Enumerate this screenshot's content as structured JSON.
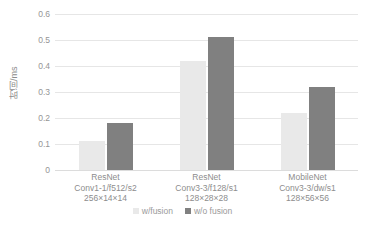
{
  "chart_data": {
    "type": "bar",
    "title": "",
    "xlabel": "",
    "ylabel": "时间/ms",
    "ylim": [
      0,
      0.6
    ],
    "yticks": [
      "0.6",
      "0.5",
      "0.4",
      "0.3",
      "0.2",
      "0.1",
      "0"
    ],
    "ytick_values": [
      0.6,
      0.5,
      0.4,
      0.3,
      0.2,
      0.1,
      0
    ],
    "grid": true,
    "legend_position": "bottom",
    "categories": [
      {
        "lines": [
          "ResNet",
          "Conv1-1/f512/s2",
          "256×14×14"
        ],
        "name": "ResNet Conv1-1/f512/s2 256×14×14"
      },
      {
        "lines": [
          "ResNet",
          "Conv3-3/f128/s1",
          "128×28×28"
        ],
        "name": "ResNet Conv3-3/f128/s1 128×28×28"
      },
      {
        "lines": [
          "MobileNet",
          "Conv3-3/dw/s1",
          "128×56×56"
        ],
        "name": "MobileNet Conv3-3/dw/s1 128×56×56"
      }
    ],
    "series": [
      {
        "name": "w/fusion",
        "color": "#e9e9e9",
        "values": [
          0.11,
          0.42,
          0.22
        ]
      },
      {
        "name": "w/o fusion",
        "color": "#808080",
        "values": [
          0.18,
          0.51,
          0.32
        ]
      }
    ]
  },
  "colors": {
    "background": "#ffffff",
    "gridline": "#e6e6e6",
    "axis_text": "#8d8d8d",
    "series_light": "#e9e9e9",
    "series_dark": "#808080"
  }
}
